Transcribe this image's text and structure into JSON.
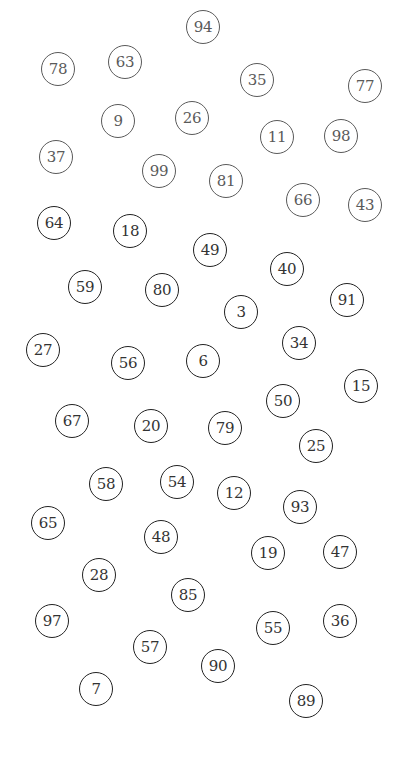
{
  "canvas": {
    "width": 406,
    "height": 761,
    "background": "#ffffff"
  },
  "style": {
    "stroke_dark": "#222222",
    "stroke_faded": "#5a5a5a",
    "text_dark": "#333333"
  },
  "circles": [
    {
      "label": "78",
      "x": 58,
      "y": 69,
      "faded": true
    },
    {
      "label": "63",
      "x": 125,
      "y": 62,
      "faded": true
    },
    {
      "label": "94",
      "x": 203,
      "y": 27,
      "faded": true
    },
    {
      "label": "35",
      "x": 257,
      "y": 80,
      "faded": true
    },
    {
      "label": "77",
      "x": 365,
      "y": 86,
      "faded": true
    },
    {
      "label": "9",
      "x": 118,
      "y": 121,
      "faded": true
    },
    {
      "label": "26",
      "x": 192,
      "y": 118,
      "faded": true
    },
    {
      "label": "11",
      "x": 277,
      "y": 137,
      "faded": true
    },
    {
      "label": "98",
      "x": 341,
      "y": 136,
      "faded": true
    },
    {
      "label": "37",
      "x": 56,
      "y": 157,
      "faded": true
    },
    {
      "label": "99",
      "x": 159,
      "y": 171,
      "faded": true
    },
    {
      "label": "81",
      "x": 226,
      "y": 181,
      "faded": true
    },
    {
      "label": "66",
      "x": 303,
      "y": 200,
      "faded": true
    },
    {
      "label": "43",
      "x": 365,
      "y": 205,
      "faded": true
    },
    {
      "label": "64",
      "x": 54,
      "y": 223,
      "faded": false
    },
    {
      "label": "18",
      "x": 130,
      "y": 231,
      "faded": false
    },
    {
      "label": "49",
      "x": 210,
      "y": 250,
      "faded": false
    },
    {
      "label": "40",
      "x": 287,
      "y": 269,
      "faded": false
    },
    {
      "label": "91",
      "x": 347,
      "y": 300,
      "faded": false
    },
    {
      "label": "59",
      "x": 85,
      "y": 287,
      "faded": false
    },
    {
      "label": "80",
      "x": 162,
      "y": 290,
      "faded": false
    },
    {
      "label": "3",
      "x": 241,
      "y": 312,
      "faded": false
    },
    {
      "label": "34",
      "x": 299,
      "y": 343,
      "faded": false
    },
    {
      "label": "27",
      "x": 43,
      "y": 350,
      "faded": false
    },
    {
      "label": "56",
      "x": 128,
      "y": 363,
      "faded": false
    },
    {
      "label": "6",
      "x": 203,
      "y": 361,
      "faded": false
    },
    {
      "label": "15",
      "x": 361,
      "y": 386,
      "faded": false
    },
    {
      "label": "50",
      "x": 283,
      "y": 401,
      "faded": false
    },
    {
      "label": "67",
      "x": 72,
      "y": 421,
      "faded": false
    },
    {
      "label": "20",
      "x": 151,
      "y": 426,
      "faded": false
    },
    {
      "label": "79",
      "x": 225,
      "y": 428,
      "faded": false
    },
    {
      "label": "25",
      "x": 316,
      "y": 446,
      "faded": false
    },
    {
      "label": "58",
      "x": 106,
      "y": 484,
      "faded": false
    },
    {
      "label": "54",
      "x": 177,
      "y": 482,
      "faded": false
    },
    {
      "label": "12",
      "x": 234,
      "y": 493,
      "faded": false
    },
    {
      "label": "93",
      "x": 300,
      "y": 507,
      "faded": false
    },
    {
      "label": "65",
      "x": 48,
      "y": 523,
      "faded": false
    },
    {
      "label": "48",
      "x": 161,
      "y": 537,
      "faded": false
    },
    {
      "label": "19",
      "x": 268,
      "y": 553,
      "faded": false
    },
    {
      "label": "47",
      "x": 340,
      "y": 552,
      "faded": false
    },
    {
      "label": "28",
      "x": 99,
      "y": 575,
      "faded": false
    },
    {
      "label": "85",
      "x": 188,
      "y": 595,
      "faded": false
    },
    {
      "label": "97",
      "x": 52,
      "y": 621,
      "faded": false
    },
    {
      "label": "55",
      "x": 273,
      "y": 628,
      "faded": false
    },
    {
      "label": "36",
      "x": 340,
      "y": 621,
      "faded": false
    },
    {
      "label": "57",
      "x": 150,
      "y": 647,
      "faded": false
    },
    {
      "label": "90",
      "x": 218,
      "y": 666,
      "faded": false
    },
    {
      "label": "7",
      "x": 96,
      "y": 689,
      "faded": false
    },
    {
      "label": "89",
      "x": 306,
      "y": 701,
      "faded": false
    }
  ]
}
